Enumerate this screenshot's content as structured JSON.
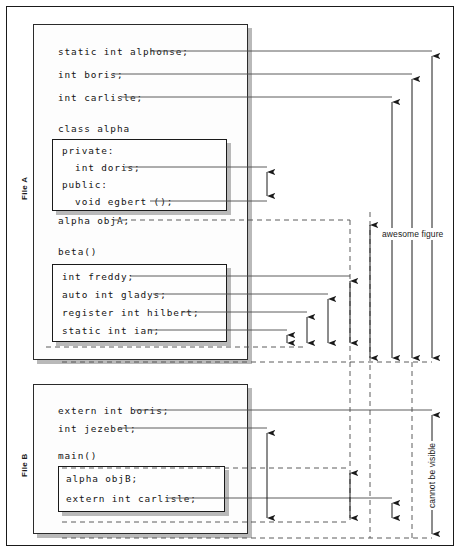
{
  "figure": {
    "type": "diagram"
  },
  "file_a": {
    "label": "File A",
    "globals": [
      "static int alphonse;",
      "int boris;",
      "int carlisle;"
    ],
    "class_header": "class alpha",
    "class_members": [
      "private:",
      "  int doris;",
      "public:",
      "  void egbert ();"
    ],
    "object_decl": "alpha objA;",
    "function_header": "beta()",
    "function_locals": [
      "int freddy;",
      "auto int gladys;",
      "register int hilbert;",
      "static int ian;"
    ]
  },
  "file_b": {
    "label": "File B",
    "globals": [
      "extern int boris;",
      "int jezebel;"
    ],
    "function_header": "main()",
    "function_locals": [
      "alpha objB;",
      "extern int carlisle;"
    ]
  },
  "annotations": {
    "awesome_figure": "awesome figure",
    "cannot_be_visible": "cannot be visible"
  },
  "colors": {
    "ink": "#1a1a1a",
    "line": "#4a4a4a",
    "shadow": "#b9b9b9",
    "paper": "#ffffff"
  }
}
